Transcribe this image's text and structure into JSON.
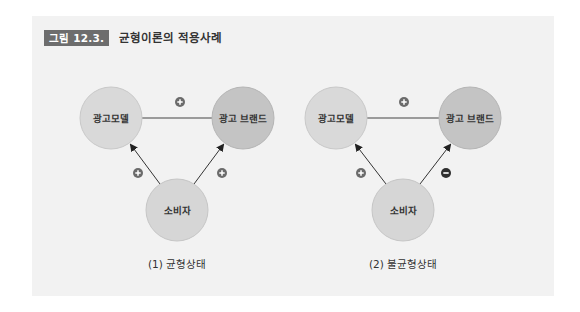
{
  "figure": {
    "label": "그림 12.3.",
    "title": "균형이론의 적용사례",
    "label_bg_color": "#6d6d6d",
    "panel_bg_color": "#f2f2f2"
  },
  "colors": {
    "model_node": "#d9d9d9",
    "brand_node": "#c4c4c4",
    "consumer_node": "#d6d6d6",
    "plus_badge": "#6b6b6b",
    "minus_badge": "#2e2e2e",
    "edge": "#444444"
  },
  "diagrams": [
    {
      "caption": "(1) 균형상태",
      "nodes": {
        "model": "광고모델",
        "brand": "광고 브랜드",
        "consumer": "소비자"
      },
      "relations": {
        "model_brand": "+",
        "consumer_model": "+",
        "consumer_brand": "+"
      }
    },
    {
      "caption": "(2) 불균형상태",
      "nodes": {
        "model": "광고모델",
        "brand": "광고 브랜드",
        "consumer": "소비자"
      },
      "relations": {
        "model_brand": "+",
        "consumer_model": "+",
        "consumer_brand": "-"
      }
    }
  ]
}
